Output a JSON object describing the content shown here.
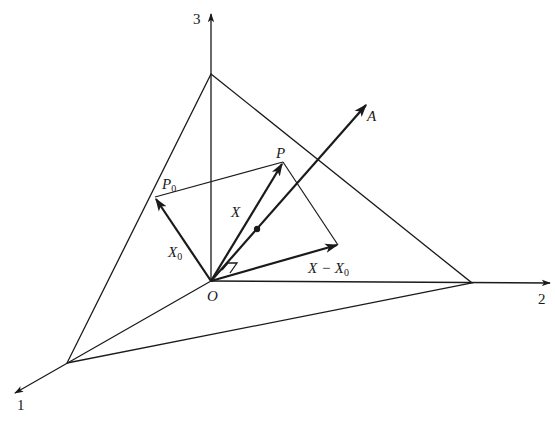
{
  "diagram": {
    "type": "3d-vector-geometry",
    "axes": [
      {
        "id": "1",
        "label": "1"
      },
      {
        "id": "2",
        "label": "2"
      },
      {
        "id": "3",
        "label": "3"
      }
    ],
    "points": {
      "origin": "O",
      "P": "P",
      "P0": {
        "main": "P",
        "sub": "0"
      },
      "A": "A"
    },
    "vectors": {
      "X": "X",
      "X0": {
        "main": "X",
        "sub": "0"
      },
      "X_minus_X0": {
        "main": "X − X",
        "sub": "0"
      }
    },
    "colors": {
      "ink": "#1a1a1a",
      "background": "#ffffff"
    }
  }
}
